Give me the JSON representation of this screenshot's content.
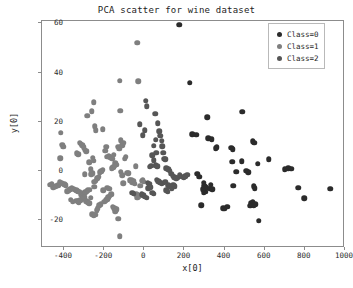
{
  "chart_data": {
    "type": "scatter",
    "title": "PCA scatter for wine dataset",
    "xlabel": "x[0]",
    "ylabel": "y[0]",
    "grid": false,
    "legend_position": "upper right",
    "xlim": [
      -510,
      1000
    ],
    "ylim": [
      -31.5,
      61
    ],
    "xticks": [
      -400,
      -200,
      0,
      200,
      400,
      600,
      800,
      1000
    ],
    "xtick_labels": [
      "-400",
      "-200",
      "0",
      "200",
      "400",
      "600",
      "800",
      "1000"
    ],
    "yticks": [
      -20,
      0,
      20,
      40,
      60
    ],
    "ytick_labels": [
      "-20",
      "0",
      "20",
      "40",
      "60"
    ],
    "marker_size": 5.5,
    "series": [
      {
        "name": "Class=0",
        "color": "#2b2b2b",
        "points": [
          [
            173,
            59.5
          ],
          [
            227,
            35.8
          ],
          [
            487,
            24.1
          ],
          [
            314,
            21.8
          ],
          [
            319,
            13.2
          ],
          [
            259,
            14.6
          ],
          [
            541,
            12.1
          ],
          [
            547,
            11.4
          ],
          [
            432,
            9.4
          ],
          [
            441,
            8.8
          ],
          [
            620,
            4.6
          ],
          [
            438,
            3.6
          ],
          [
            565,
            2.9
          ],
          [
            508,
            -0.1
          ],
          [
            517,
            -0.7
          ],
          [
            700,
            0.6
          ],
          [
            718,
            0.9
          ],
          [
            731,
            0.8
          ],
          [
            273,
            -2.5
          ],
          [
            296,
            -5.0
          ],
          [
            299,
            -6.2
          ],
          [
            302,
            -7.3
          ],
          [
            305,
            -6.8
          ],
          [
            300,
            -8.2
          ],
          [
            296,
            -8.9
          ],
          [
            307,
            -8.6
          ],
          [
            292,
            -7.6
          ],
          [
            311,
            -7.0
          ],
          [
            330,
            -5.8
          ],
          [
            327,
            -7.4
          ],
          [
            339,
            -7.6
          ],
          [
            443,
            -6.1
          ],
          [
            544,
            -6.4
          ],
          [
            551,
            -7.1
          ],
          [
            766,
            -7.0
          ],
          [
            927,
            -7.4
          ],
          [
            798,
            -11.3
          ],
          [
            283,
            -14.1
          ],
          [
            392,
            -15.3
          ],
          [
            401,
            -15.5
          ],
          [
            412,
            -14.6
          ],
          [
            528,
            -14.3
          ],
          [
            534,
            -13.2
          ],
          [
            540,
            -12.8
          ],
          [
            545,
            -14.1
          ],
          [
            552,
            -13.6
          ],
          [
            571,
            -20.3
          ],
          [
            264,
            -1.3
          ],
          [
            238,
            14.8
          ],
          [
            335,
            12.9
          ],
          [
            458,
            -0.4
          ],
          [
            486,
            3.8
          ],
          [
            355,
            9.2
          ],
          [
            361,
            9.6
          ]
        ]
      },
      {
        "name": "Class=1",
        "color": "#7f7f7f",
        "points": [
          [
            -416,
            15.5
          ],
          [
            -404,
            9.8
          ],
          [
            -409,
            10.5
          ],
          [
            -418,
            5.1
          ],
          [
            -284,
            22.3
          ],
          [
            -262,
            24.3
          ],
          [
            -252,
            27.9
          ],
          [
            -247,
            18.1
          ],
          [
            -243,
            16.4
          ],
          [
            -208,
            16.9
          ],
          [
            -122,
            36.7
          ],
          [
            -36,
            52.2
          ],
          [
            -31,
            36.4
          ],
          [
            -120,
            24.4
          ],
          [
            -191,
            9.8
          ],
          [
            -196,
            8.1
          ],
          [
            -253,
            4.0
          ],
          [
            -258,
            5.2
          ],
          [
            -275,
            3.5
          ],
          [
            -289,
            7.9
          ],
          [
            -296,
            8.6
          ],
          [
            -303,
            9.6
          ],
          [
            -310,
            10.3
          ],
          [
            -317,
            11.0
          ],
          [
            -322,
            11.4
          ],
          [
            -330,
            6.8
          ],
          [
            -337,
            7.1
          ],
          [
            -186,
            5.7
          ],
          [
            -178,
            6.0
          ],
          [
            -169,
            5.5
          ],
          [
            -160,
            4.9
          ],
          [
            -152,
            6.4
          ],
          [
            -145,
            3.0
          ],
          [
            -138,
            2.4
          ],
          [
            -131,
            9.7
          ],
          [
            -124,
            8.9
          ],
          [
            -117,
            12.4
          ],
          [
            -111,
            10.3
          ],
          [
            -104,
            11.3
          ],
          [
            -98,
            4.8
          ],
          [
            -92,
            5.6
          ],
          [
            -86,
            -0.9
          ],
          [
            -79,
            -1.1
          ],
          [
            -73,
            -3.9
          ],
          [
            -66,
            -3.6
          ],
          [
            -60,
            -4.7
          ],
          [
            -54,
            -4.2
          ],
          [
            -47,
            -5.4
          ],
          [
            -41,
            -9.5
          ],
          [
            -35,
            -9.8
          ],
          [
            -28,
            -10.4
          ],
          [
            -20,
            -6.2
          ],
          [
            -14,
            -4.1
          ],
          [
            -8,
            -3.8
          ],
          [
            -2,
            -4.5
          ],
          [
            -207,
            0.3
          ],
          [
            -214,
            -0.3
          ],
          [
            -221,
            -0.7
          ],
          [
            -228,
            -2.4
          ],
          [
            -235,
            -3.1
          ],
          [
            -243,
            -4.0
          ],
          [
            -250,
            -4.5
          ],
          [
            -258,
            -1.0
          ],
          [
            -265,
            -1.4
          ],
          [
            -273,
            -7.7
          ],
          [
            -281,
            -8.0
          ],
          [
            -288,
            -8.4
          ],
          [
            -295,
            -8.8
          ],
          [
            -302,
            -9.1
          ],
          [
            -310,
            -9.5
          ],
          [
            -318,
            -9.8
          ],
          [
            -325,
            -8.6
          ],
          [
            -332,
            -8.3
          ],
          [
            -340,
            -8.0
          ],
          [
            -347,
            -7.7
          ],
          [
            -355,
            -7.4
          ],
          [
            -362,
            -7.1
          ],
          [
            -369,
            -7.5
          ],
          [
            -377,
            -7.9
          ],
          [
            -384,
            -8.3
          ],
          [
            -392,
            -5.9
          ],
          [
            -399,
            -5.6
          ],
          [
            -407,
            -5.3
          ],
          [
            -415,
            -5.0
          ],
          [
            -422,
            -4.7
          ],
          [
            -430,
            -5.9
          ],
          [
            -438,
            -6.2
          ],
          [
            -445,
            -6.5
          ],
          [
            -453,
            -6.8
          ],
          [
            -461,
            -5.4
          ],
          [
            -468,
            -5.8
          ],
          [
            -340,
            -12.2
          ],
          [
            -333,
            -12.5
          ],
          [
            -326,
            -12.8
          ],
          [
            -319,
            -12.0
          ],
          [
            -311,
            -11.6
          ],
          [
            -304,
            -11.2
          ],
          [
            -296,
            -10.8
          ],
          [
            -289,
            -12.4
          ],
          [
            -281,
            -12.9
          ],
          [
            -274,
            -13.3
          ],
          [
            -266,
            -11.1
          ],
          [
            -259,
            -17.8
          ],
          [
            -252,
            -18.3
          ],
          [
            -245,
            -18.0
          ],
          [
            -238,
            -16.2
          ],
          [
            -231,
            -15.4
          ],
          [
            -224,
            -14.1
          ],
          [
            -217,
            -13.6
          ],
          [
            -200,
            -12.7
          ],
          [
            -193,
            -12.1
          ],
          [
            -186,
            -11.6
          ],
          [
            -179,
            -10.9
          ],
          [
            -172,
            -10.2
          ],
          [
            -165,
            -9.6
          ],
          [
            -158,
            -14.7
          ],
          [
            -151,
            -15.2
          ],
          [
            -144,
            -16.5
          ],
          [
            -137,
            -15.8
          ],
          [
            -130,
            -19.6
          ],
          [
            -123,
            -26.8
          ],
          [
            -162,
            0.9
          ],
          [
            -155,
            1.4
          ],
          [
            -148,
            2.1
          ],
          [
            -268,
            0.6
          ],
          [
            -296,
            -1.5
          ],
          [
            -118,
            -0.4
          ],
          [
            -111,
            -1.8
          ],
          [
            -105,
            -5.1
          ],
          [
            -43,
            1.9
          ],
          [
            -36,
            -11.1
          ],
          [
            -250,
            -6.5
          ],
          [
            -185,
            -6.9
          ],
          [
            -174,
            -7.3
          ],
          [
            -205,
            -7.9
          ],
          [
            -367,
            -11.9
          ],
          [
            -357,
            -12.6
          ]
        ]
      },
      {
        "name": "Class=2",
        "color": "#565656",
        "points": [
          [
            8,
            28.5
          ],
          [
            12,
            26.2
          ],
          [
            54,
            23.2
          ],
          [
            -24,
            18.9
          ],
          [
            2,
            16.5
          ],
          [
            -7,
            14.5
          ],
          [
            68,
            19.3
          ],
          [
            74,
            16.0
          ],
          [
            80,
            14.2
          ],
          [
            86,
            12.3
          ],
          [
            90,
            9.9
          ],
          [
            94,
            7.3
          ],
          [
            98,
            4.9
          ],
          [
            104,
            4.6
          ],
          [
            56,
            12.6
          ],
          [
            48,
            10.1
          ],
          [
            40,
            6.2
          ],
          [
            34,
            2.1
          ],
          [
            28,
            1.6
          ],
          [
            58,
            2.3
          ],
          [
            64,
            1.9
          ],
          [
            110,
            1.1
          ],
          [
            118,
            0.6
          ],
          [
            126,
            -0.1
          ],
          [
            133,
            -1.2
          ],
          [
            62,
            -3.6
          ],
          [
            70,
            -4.2
          ],
          [
            78,
            -4.8
          ],
          [
            86,
            -5.4
          ],
          [
            96,
            -5.0
          ],
          [
            104,
            -4.4
          ],
          [
            142,
            -2.0
          ],
          [
            150,
            -2.6
          ],
          [
            158,
            -3.1
          ],
          [
            166,
            -2.8
          ],
          [
            176,
            -1.9
          ],
          [
            186,
            -2.4
          ],
          [
            196,
            -2.9
          ],
          [
            205,
            -2.2
          ],
          [
            214,
            -1.7
          ],
          [
            120,
            -6.0
          ],
          [
            128,
            -6.6
          ],
          [
            136,
            -7.1
          ],
          [
            18,
            -4.9
          ],
          [
            24,
            -5.3
          ],
          [
            -14,
            -9.6
          ],
          [
            -6,
            -10.1
          ],
          [
            3,
            -10.6
          ],
          [
            12,
            -11.0
          ],
          [
            20,
            -7.2
          ],
          [
            30,
            -6.7
          ],
          [
            40,
            -8.9
          ],
          [
            46,
            -9.4
          ],
          [
            -60,
            -9.0
          ],
          [
            -52,
            -9.4
          ],
          [
            144,
            -5.8
          ],
          [
            152,
            -6.3
          ],
          [
            108,
            -8.0
          ],
          [
            116,
            -8.5
          ],
          [
            60,
            7.4
          ],
          [
            46,
            4.2
          ]
        ]
      }
    ]
  },
  "legend": {
    "entries": [
      {
        "label": "Class=0",
        "color": "#2b2b2b"
      },
      {
        "label": "Class=1",
        "color": "#7f7f7f"
      },
      {
        "label": "Class=2",
        "color": "#565656"
      }
    ]
  }
}
